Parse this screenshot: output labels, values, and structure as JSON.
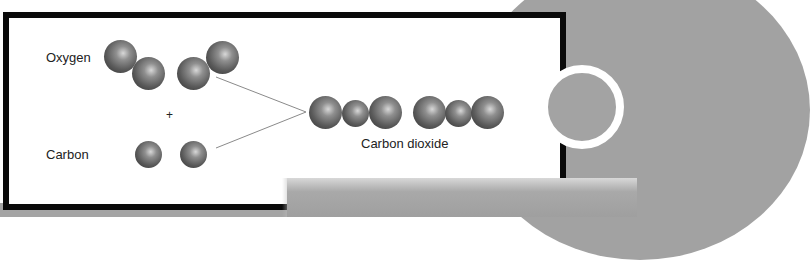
{
  "diagram": {
    "reactants": [
      {
        "label": "Oxygen",
        "molecules": 2,
        "atoms_per_molecule": 2
      },
      {
        "label": "Carbon",
        "molecules": 2,
        "atoms_per_molecule": 1
      }
    ],
    "operator": "+",
    "product": {
      "label": "Carbon dioxide",
      "molecules": 2,
      "atoms_per_molecule": 3
    },
    "colors": {
      "frame": "#0a0a0a",
      "background_gray": "#a2a2a2",
      "atom": "#5a5a5a",
      "connector_line": "#8a8a8a"
    }
  }
}
